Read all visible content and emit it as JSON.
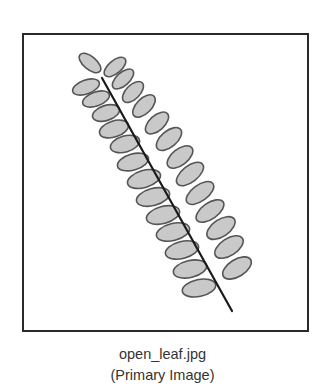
{
  "figure": {
    "filename": "open_leaf.jpg",
    "subtitle": "(Primary Image)",
    "frame": {
      "x": 22,
      "y": 33,
      "width": 285,
      "height": 297,
      "border_color": "#2a2a2a"
    },
    "colors": {
      "leaflet_fill": "#c9c9c9",
      "leaflet_stroke": "#555555",
      "stem": "#1a1a1a"
    },
    "stem": {
      "x1": 102,
      "y1": 78,
      "x2": 232,
      "y2": 311
    },
    "leaflets_left": [
      {
        "cx": 90,
        "cy": 63,
        "rx": 13,
        "ry": 6.5,
        "angle": 40
      },
      {
        "cx": 86,
        "cy": 87,
        "rx": 14,
        "ry": 7,
        "angle": -20
      },
      {
        "cx": 96,
        "cy": 99,
        "rx": 14,
        "ry": 7,
        "angle": -20
      },
      {
        "cx": 106,
        "cy": 113,
        "rx": 14,
        "ry": 7.5,
        "angle": -18
      },
      {
        "cx": 114,
        "cy": 129,
        "rx": 15,
        "ry": 8,
        "angle": -18
      },
      {
        "cx": 125,
        "cy": 144,
        "rx": 15,
        "ry": 8,
        "angle": -16
      },
      {
        "cx": 133,
        "cy": 162,
        "rx": 16,
        "ry": 8,
        "angle": -16
      },
      {
        "cx": 144,
        "cy": 179,
        "rx": 17,
        "ry": 8.5,
        "angle": -16
      },
      {
        "cx": 153,
        "cy": 197,
        "rx": 17,
        "ry": 8.5,
        "angle": -15
      },
      {
        "cx": 163,
        "cy": 215,
        "rx": 17,
        "ry": 8.5,
        "angle": -15
      },
      {
        "cx": 173,
        "cy": 232,
        "rx": 17,
        "ry": 8.5,
        "angle": -14
      },
      {
        "cx": 182,
        "cy": 250,
        "rx": 17,
        "ry": 8.5,
        "angle": -14
      },
      {
        "cx": 190,
        "cy": 269,
        "rx": 17,
        "ry": 8.5,
        "angle": -13
      },
      {
        "cx": 199,
        "cy": 288,
        "rx": 17,
        "ry": 8.5,
        "angle": -12
      }
    ],
    "leaflets_right": [
      {
        "cx": 115,
        "cy": 67,
        "rx": 13,
        "ry": 6.5,
        "angle": -40
      },
      {
        "cx": 123,
        "cy": 79,
        "rx": 13,
        "ry": 6.5,
        "angle": -42
      },
      {
        "cx": 133,
        "cy": 92,
        "rx": 13,
        "ry": 7,
        "angle": -45
      },
      {
        "cx": 144,
        "cy": 106,
        "rx": 14,
        "ry": 7.5,
        "angle": -45
      },
      {
        "cx": 157,
        "cy": 123,
        "rx": 14,
        "ry": 7.5,
        "angle": -42
      },
      {
        "cx": 169,
        "cy": 139,
        "rx": 15,
        "ry": 8,
        "angle": -40
      },
      {
        "cx": 180,
        "cy": 157,
        "rx": 15,
        "ry": 8,
        "angle": -38
      },
      {
        "cx": 190,
        "cy": 174,
        "rx": 16,
        "ry": 8,
        "angle": -38
      },
      {
        "cx": 200,
        "cy": 193,
        "rx": 16,
        "ry": 8,
        "angle": -36
      },
      {
        "cx": 210,
        "cy": 211,
        "rx": 16,
        "ry": 8,
        "angle": -35
      },
      {
        "cx": 221,
        "cy": 228,
        "rx": 16,
        "ry": 8.5,
        "angle": -34
      },
      {
        "cx": 229,
        "cy": 247,
        "rx": 16,
        "ry": 8.5,
        "angle": -33
      },
      {
        "cx": 237,
        "cy": 268,
        "rx": 16,
        "ry": 8.5,
        "angle": -32
      }
    ]
  }
}
